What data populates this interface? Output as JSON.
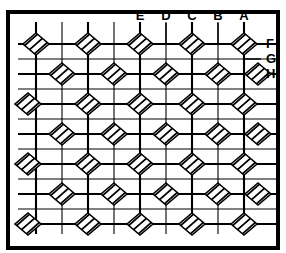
{
  "figure": {
    "kind": "lattice-mesh-diagram",
    "background_color": "#ffffff",
    "line_color": "#000000",
    "frame": {
      "name": "outer-border",
      "x": 8,
      "y": 12,
      "width": 270,
      "height": 236,
      "stroke_width": 4
    },
    "plot_area": {
      "x": 18,
      "y": 22,
      "width": 242,
      "height": 212
    },
    "grid": {
      "thick_stroke_width": 2.1,
      "thin_stroke_width": 1.1,
      "vertical_lines": [
        {
          "x": 36,
          "weight": "thick"
        },
        {
          "x": 62,
          "weight": "thin"
        },
        {
          "x": 88,
          "weight": "thick"
        },
        {
          "x": 114,
          "weight": "thin"
        },
        {
          "x": 140,
          "weight": "thick"
        },
        {
          "x": 166,
          "weight": "thin"
        },
        {
          "x": 192,
          "weight": "thick"
        },
        {
          "x": 218,
          "weight": "thin"
        },
        {
          "x": 244,
          "weight": "thick"
        }
      ],
      "horizontal_lines": [
        {
          "y": 44,
          "weight": "thick"
        },
        {
          "y": 59,
          "weight": "thin"
        },
        {
          "y": 74,
          "weight": "thick"
        },
        {
          "y": 89,
          "weight": "thin"
        },
        {
          "y": 104,
          "weight": "thick"
        },
        {
          "y": 119,
          "weight": "thin"
        },
        {
          "y": 134,
          "weight": "thick"
        },
        {
          "y": 149,
          "weight": "thin"
        },
        {
          "y": 164,
          "weight": "thick"
        },
        {
          "y": 179,
          "weight": "thin"
        },
        {
          "y": 194,
          "weight": "thick"
        },
        {
          "y": 209,
          "weight": "thin"
        },
        {
          "y": 224,
          "weight": "thick"
        }
      ]
    },
    "element": {
      "name": "hatched-diamond",
      "shape": "rotated-square",
      "half_width": 13,
      "half_height": 11,
      "outline_stroke_width": 1.6,
      "hatch_line_count": 5,
      "hatch_stroke_width": 1.7,
      "hatch_direction": "lower-left-to-upper-right"
    },
    "diamond_rows": [
      {
        "row": 1,
        "y": 44,
        "offset": "even",
        "cx": [
          36,
          88,
          140,
          192,
          244
        ]
      },
      {
        "row": 2,
        "y": 74,
        "offset": "odd",
        "cx": [
          62,
          114,
          166,
          218,
          258
        ]
      },
      {
        "row": 3,
        "y": 104,
        "offset": "even",
        "cx": [
          28,
          88,
          140,
          192,
          244
        ]
      },
      {
        "row": 4,
        "y": 134,
        "offset": "odd",
        "cx": [
          62,
          114,
          166,
          218,
          258
        ]
      },
      {
        "row": 5,
        "y": 164,
        "offset": "even",
        "cx": [
          28,
          88,
          140,
          192,
          244
        ]
      },
      {
        "row": 6,
        "y": 194,
        "offset": "odd",
        "cx": [
          62,
          114,
          166,
          218,
          258
        ]
      },
      {
        "row": 7,
        "y": 224,
        "offset": "even",
        "cx": [
          28,
          88,
          140,
          192,
          244
        ]
      }
    ],
    "column_labels": [
      {
        "text": "E",
        "x": 140,
        "y": 20,
        "leader_x": 140,
        "leader_from": 23,
        "leader_to": 44
      },
      {
        "text": "D",
        "x": 166,
        "y": 20,
        "leader_x": 166,
        "leader_from": 23,
        "leader_to": 44
      },
      {
        "text": "C",
        "x": 192,
        "y": 20,
        "leader_x": 192,
        "leader_from": 23,
        "leader_to": 44
      },
      {
        "text": "B",
        "x": 218,
        "y": 20,
        "leader_x": 218,
        "leader_from": 23,
        "leader_to": 44
      },
      {
        "text": "A",
        "x": 244,
        "y": 20,
        "leader_x": 244,
        "leader_from": 23,
        "leader_to": 44
      }
    ],
    "row_labels": [
      {
        "text": "F",
        "x": 266,
        "y": 48,
        "leader_y": 44,
        "leader_from": 244,
        "leader_to": 261
      },
      {
        "text": "G",
        "x": 266,
        "y": 63,
        "leader_y": 59,
        "leader_from": 244,
        "leader_to": 261
      },
      {
        "text": "H",
        "x": 266,
        "y": 78,
        "leader_y": 74,
        "leader_from": 246,
        "leader_to": 261
      }
    ]
  }
}
